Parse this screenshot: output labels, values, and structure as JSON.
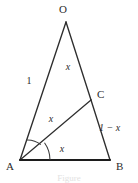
{
  "figure": {
    "caption": "Figure",
    "vertices": [
      {
        "id": "O",
        "label": "O",
        "x": 66,
        "y": 22,
        "label_x": 63,
        "label_y": 13
      },
      {
        "id": "A",
        "label": "A",
        "x": 20,
        "y": 160,
        "label_x": 6,
        "label_y": 170
      },
      {
        "id": "B",
        "label": "B",
        "x": 110,
        "y": 160,
        "label_x": 116,
        "label_y": 170
      },
      {
        "id": "C",
        "label": "C",
        "x": 91,
        "y": 100,
        "label_x": 97,
        "label_y": 98
      }
    ],
    "segments": [
      {
        "id": "OA",
        "from": "O",
        "to": "A",
        "label": "1",
        "label_style": "upright",
        "label_x": 29,
        "label_y": 84
      },
      {
        "id": "OB",
        "from": "O",
        "to": "B",
        "label": "",
        "label_style": "upright",
        "label_x": 0,
        "label_y": 0
      },
      {
        "id": "OC",
        "from": "O",
        "to": "C",
        "label": "x",
        "label_style": "italic",
        "label_x": 68,
        "label_y": 70
      },
      {
        "id": "CB",
        "from": "C",
        "to": "B",
        "label": "1 − x",
        "label_style": "mixed",
        "label_x": 99,
        "label_y": 131
      },
      {
        "id": "AC",
        "from": "A",
        "to": "C",
        "label": "x",
        "label_style": "italic",
        "label_x": 51,
        "label_y": 122
      },
      {
        "id": "AB",
        "from": "A",
        "to": "B",
        "label": "x",
        "label_style": "italic",
        "label_x": 62,
        "label_y": 152
      }
    ],
    "angle_marks": [
      {
        "id": "angle-OAC",
        "vertex": "A",
        "radius": 21,
        "description": "arc between AO and AC"
      },
      {
        "id": "angle-CAB",
        "vertex": "A",
        "radius": 30,
        "description": "arc between AC and AB"
      }
    ],
    "colors": {
      "stroke": "#2e2e2e",
      "base_stroke": "#1c1c1c",
      "label": "#2b2b2b",
      "background": "#ffffff",
      "caption": "#e2e2e2"
    }
  }
}
